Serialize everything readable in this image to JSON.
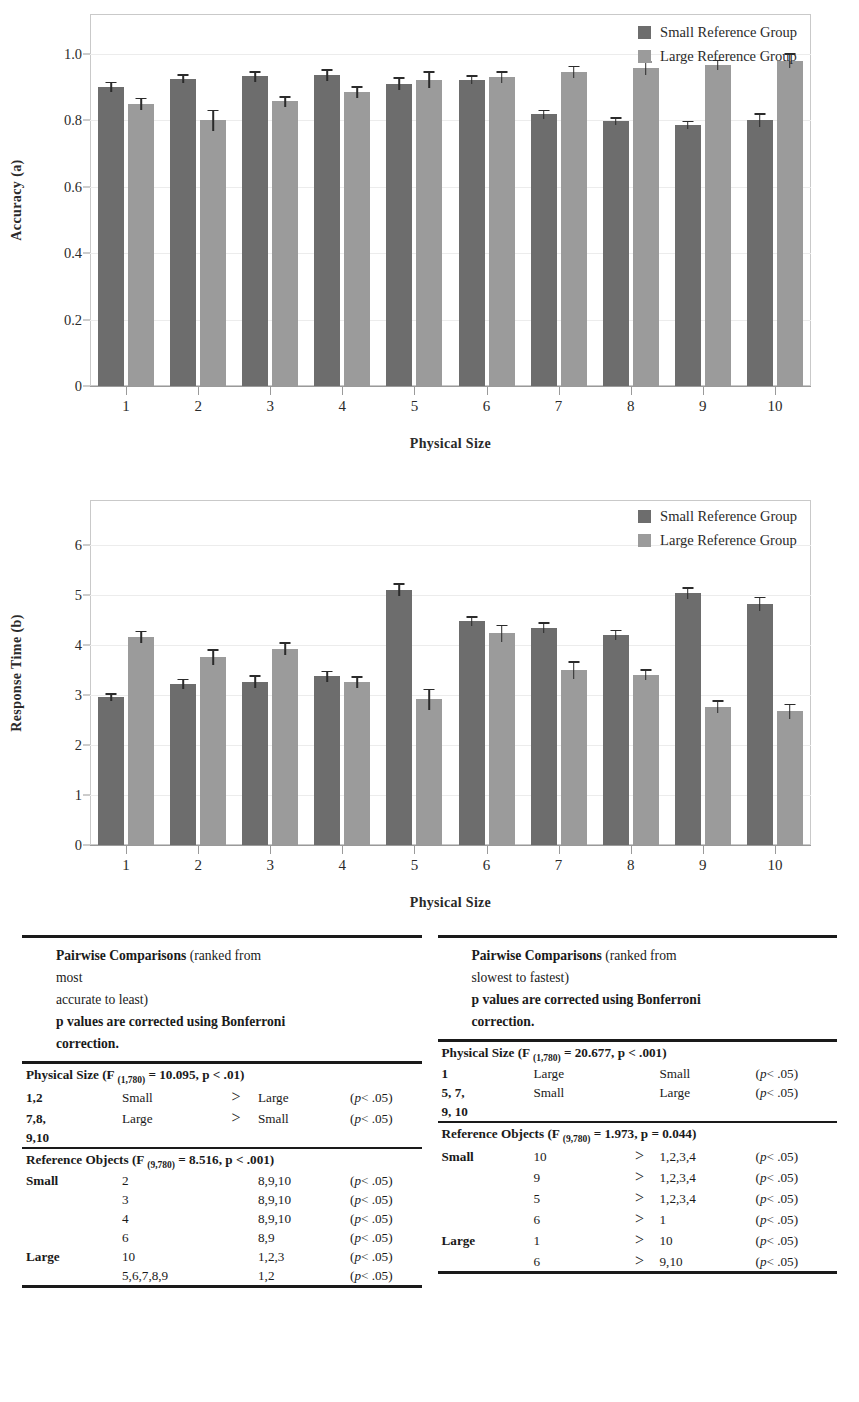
{
  "chart_data": [
    {
      "type": "bar",
      "title": "",
      "panel": "a",
      "xlabel": "Physical Size",
      "ylabel": "Accuracy (a)",
      "categories": [
        "1",
        "2",
        "3",
        "4",
        "5",
        "6",
        "7",
        "8",
        "9",
        "10"
      ],
      "yticks": [
        "0",
        "0.2",
        "0.4",
        "0.6",
        "0.8",
        "1.0"
      ],
      "ylim": [
        0,
        1.12
      ],
      "grid": true,
      "legend_position": "top-right",
      "series": [
        {
          "name": "Small Reference Group",
          "color": "#6d6d6d",
          "values": [
            0.9,
            0.925,
            0.932,
            0.935,
            0.91,
            0.922,
            0.818,
            0.798,
            0.787,
            0.8
          ],
          "errors": [
            0.016,
            0.014,
            0.016,
            0.018,
            0.02,
            0.014,
            0.014,
            0.012,
            0.012,
            0.021
          ]
        },
        {
          "name": "Large Reference Group",
          "color": "#9b9b9b",
          "values": [
            0.85,
            0.8,
            0.857,
            0.885,
            0.922,
            0.93,
            0.945,
            0.957,
            0.967,
            0.98
          ],
          "errors": [
            0.018,
            0.032,
            0.016,
            0.018,
            0.025,
            0.017,
            0.019,
            0.02,
            0.015,
            0.022
          ]
        }
      ]
    },
    {
      "type": "bar",
      "title": "",
      "panel": "b",
      "xlabel": "Physical Size",
      "ylabel": "Response Time (b)",
      "categories": [
        "1",
        "2",
        "3",
        "4",
        "5",
        "6",
        "7",
        "8",
        "9",
        "10"
      ],
      "yticks": [
        "0",
        "1",
        "2",
        "3",
        "4",
        "5",
        "6"
      ],
      "ylim": [
        0,
        6.9
      ],
      "grid": true,
      "legend_position": "top-right",
      "series": [
        {
          "name": "Small Reference Group",
          "color": "#6d6d6d",
          "values": [
            2.96,
            3.23,
            3.27,
            3.38,
            5.11,
            4.48,
            4.35,
            4.21,
            5.04,
            4.83
          ],
          "errors": [
            0.08,
            0.1,
            0.13,
            0.11,
            0.13,
            0.1,
            0.11,
            0.1,
            0.12,
            0.14
          ]
        },
        {
          "name": "Large Reference Group",
          "color": "#9b9b9b",
          "values": [
            4.17,
            3.76,
            3.93,
            3.26,
            2.92,
            4.24,
            3.5,
            3.41,
            2.77,
            2.68
          ],
          "errors": [
            0.12,
            0.16,
            0.13,
            0.12,
            0.21,
            0.17,
            0.18,
            0.11,
            0.13,
            0.15
          ]
        }
      ]
    }
  ],
  "tables": {
    "left": {
      "caption_lines": [
        {
          "bold": "Pairwise Comparisons",
          "rest": " (ranked from"
        },
        {
          "bold": "",
          "rest": "most"
        },
        {
          "bold": "",
          "rest": "accurate to least)"
        },
        {
          "bold": "p values are corrected using Bonferroni",
          "rest": ""
        },
        {
          "bold": "correction.",
          "rest": ""
        }
      ],
      "sections": [
        {
          "heading_main": "Physical Size",
          "heading_rest_pre": " (F ",
          "heading_sub": "(1,780)",
          "heading_rest_post": " = 10.095, p < .01)",
          "rows": [
            {
              "label": "1,2",
              "a": "Small",
              "gt": ">",
              "b": "Large",
              "p": ".05)"
            },
            {
              "label": "7,8,",
              "a": "Large",
              "gt": ">",
              "b": "Small",
              "p": ".05)"
            },
            {
              "label": "9,10",
              "a": "",
              "gt": "",
              "b": "",
              "p": ""
            }
          ]
        },
        {
          "heading_main": "Reference Objects",
          "heading_rest_pre": " (F ",
          "heading_sub": "(9,780)",
          "heading_rest_post": " = 8.516, p < .001)",
          "rows": [
            {
              "label": "Small",
              "a": "2",
              "gt": "",
              "b": "8,9,10",
              "p": ".05)"
            },
            {
              "label": "",
              "a": "3",
              "gt": "",
              "b": "8,9,10",
              "p": ".05)"
            },
            {
              "label": "",
              "a": "4",
              "gt": "",
              "b": "8,9,10",
              "p": ".05)"
            },
            {
              "label": "",
              "a": "6",
              "gt": "",
              "b": "8,9",
              "p": ".05)"
            },
            {
              "label": "Large",
              "a": "10",
              "gt": "",
              "b": "1,2,3",
              "p": ".05)"
            },
            {
              "label": "",
              "a": "5,6,7,8,9",
              "gt": "",
              "b": "1,2",
              "p": ".05)"
            }
          ]
        }
      ]
    },
    "right": {
      "caption_lines": [
        {
          "bold": "Pairwise Comparisons",
          "rest": " (ranked from"
        },
        {
          "bold": "",
          "rest": "slowest to fastest)"
        },
        {
          "bold": "p values are corrected using Bonferroni",
          "rest": ""
        },
        {
          "bold": "correction.",
          "rest": ""
        }
      ],
      "sections": [
        {
          "heading_main": "Physical Size",
          "heading_rest_pre": " (F ",
          "heading_sub": "(1,780)",
          "heading_rest_post": " = 20.677, p < .001)",
          "rows": [
            {
              "label": "1",
              "a": "Large",
              "gt": "",
              "b": "Small",
              "p": ".05)"
            },
            {
              "label": "5, 7,",
              "a": "Small",
              "gt": "",
              "b": "Large",
              "p": ".05)"
            },
            {
              "label": "9, 10",
              "a": "",
              "gt": "",
              "b": "",
              "p": ""
            }
          ]
        },
        {
          "heading_main": "Reference Objects",
          "heading_rest_pre": " (F ",
          "heading_sub": "(9,780)",
          "heading_rest_post": " = 1.973, p = 0.044)",
          "rows": [
            {
              "label": "Small",
              "a": "10",
              "gt": ">",
              "b": "1,2,3,4",
              "p": ".05)"
            },
            {
              "label": "",
              "a": "9",
              "gt": ">",
              "b": "1,2,3,4",
              "p": ".05)"
            },
            {
              "label": "",
              "a": "5",
              "gt": ">",
              "b": "1,2,3,4",
              "p": ".05)"
            },
            {
              "label": "",
              "a": "6",
              "gt": ">",
              "b": "1",
              "p": ".05)"
            },
            {
              "label": "Large",
              "a": "1",
              "gt": ">",
              "b": "10",
              "p": ".05)"
            },
            {
              "label": "",
              "a": "6",
              "gt": ">",
              "b": "9,10",
              "p": ".05)"
            }
          ]
        }
      ]
    }
  },
  "p_prefix": "(p < "
}
